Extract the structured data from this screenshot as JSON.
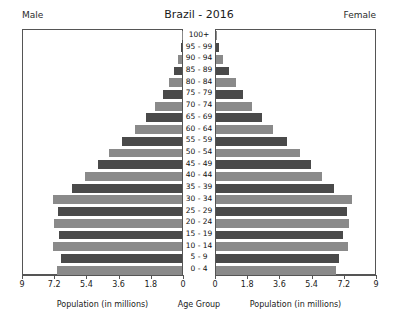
{
  "header": {
    "title": "Brazil - 2016",
    "left_label": "Male",
    "right_label": "Female"
  },
  "captions": {
    "left": "Population (in millions)",
    "center": "Age Group",
    "right": "Population (in millions)"
  },
  "colors": {
    "bar_dark": "#4a4a4a",
    "bar_light": "#8a8a8a",
    "frame": "#555555",
    "text": "#1a1a1a",
    "background": "#ffffff"
  },
  "chart_data": {
    "type": "bar",
    "subtype": "population-pyramid",
    "title": "Brazil - 2016",
    "xlabel": "Population (in millions)",
    "ylabel": "Age Group",
    "grid": false,
    "legend_position": "top-corners",
    "xlim_left": [
      9,
      0
    ],
    "xlim_right": [
      0,
      9
    ],
    "xticks_left": [
      "9",
      "7.2",
      "5.4",
      "3.6",
      "1.8",
      "0"
    ],
    "xticks_right": [
      "0",
      "1.8",
      "3.6",
      "5.4",
      "7.2",
      "9"
    ],
    "xtick_values_left": [
      9,
      7.2,
      5.4,
      3.6,
      1.8,
      0
    ],
    "xtick_values_right": [
      0,
      1.8,
      3.6,
      5.4,
      7.2,
      9
    ],
    "categories": [
      "100+",
      "95 - 99",
      "90 - 94",
      "85 - 89",
      "80 - 84",
      "75 - 79",
      "70 - 74",
      "65 - 69",
      "60 - 64",
      "55 - 59",
      "50 - 54",
      "45 - 49",
      "40 - 44",
      "35 - 39",
      "30 - 34",
      "25 - 29",
      "20 - 24",
      "15 - 19",
      "10 - 14",
      "5 - 9",
      "0 - 4"
    ],
    "series": [
      {
        "name": "Male",
        "side": "left",
        "values": [
          0.02,
          0.08,
          0.22,
          0.44,
          0.73,
          1.08,
          1.52,
          2.03,
          2.62,
          3.33,
          4.08,
          4.72,
          5.4,
          6.14,
          7.2,
          6.92,
          7.18,
          6.85,
          7.24,
          6.78,
          6.98
        ]
      },
      {
        "name": "Female",
        "side": "right",
        "values": [
          0.05,
          0.15,
          0.37,
          0.7,
          1.1,
          1.52,
          2.02,
          2.58,
          3.21,
          3.95,
          4.7,
          5.32,
          5.92,
          6.6,
          7.62,
          7.35,
          7.45,
          7.12,
          7.38,
          6.88,
          6.72
        ]
      }
    ]
  }
}
